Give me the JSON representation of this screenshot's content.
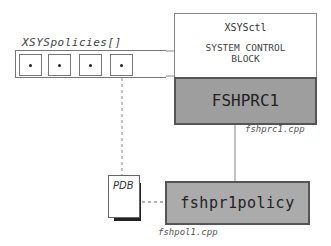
{
  "array": {
    "label": "XSYSpolicies[]",
    "cells": [
      {
        "has_pointer": true
      },
      {
        "has_pointer": true
      },
      {
        "has_pointer": true
      },
      {
        "has_pointer": true
      }
    ]
  },
  "control_block": {
    "title": "XSYSctl",
    "desc_line1": "SYSTEM CONTROL",
    "desc_line2": "BLOCK"
  },
  "prc": {
    "label": "FSHPRC1",
    "file": "fshprc1.cpp",
    "color": "#9e9e9e"
  },
  "policy": {
    "label": "fshpr1policy",
    "file": "fshpol1.cpp",
    "color": "#ababab"
  },
  "pdb": {
    "label": "PDB"
  }
}
